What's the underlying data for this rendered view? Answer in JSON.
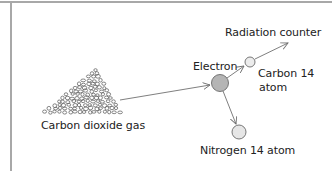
{
  "diagram": {
    "title": "",
    "labels": {
      "gas": "Carbon dioxide gas",
      "electron": "Electron",
      "radiation_counter": "Radiation counter",
      "carbon14_line1": "Carbon 14",
      "carbon14_line2": "atom",
      "nitrogen14": "Nitrogen 14 atom"
    },
    "nodes": [
      {
        "id": "co2-gas",
        "type": "particle-cluster",
        "label": "Carbon dioxide gas"
      },
      {
        "id": "electron",
        "type": "circle",
        "label": "Electron",
        "fill": "#b5b5b5"
      },
      {
        "id": "carbon14",
        "type": "circle",
        "label": "Carbon 14 atom",
        "fill": "#ececec"
      },
      {
        "id": "nitrogen14",
        "type": "circle",
        "label": "Nitrogen 14 atom",
        "fill": "#e6e6e6"
      },
      {
        "id": "radiation-counter",
        "type": "arrow-target",
        "label": "Radiation counter"
      }
    ],
    "edges": [
      {
        "from": "co2-gas",
        "to": "electron"
      },
      {
        "from": "electron",
        "to": "carbon14"
      },
      {
        "from": "carbon14",
        "to": "radiation-counter"
      },
      {
        "from": "electron",
        "to": "nitrogen14"
      }
    ],
    "colors": {
      "frame": "#a8a8a8",
      "line": "#707070",
      "text": "#222222"
    }
  }
}
